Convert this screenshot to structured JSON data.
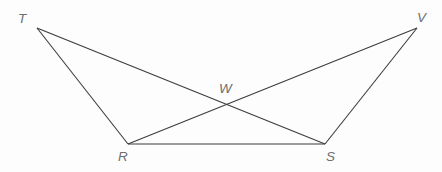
{
  "figure": {
    "kind": "geometry-diagram",
    "width": 442,
    "height": 172,
    "background_color": "#fdfdfd",
    "line_color": "#3c3c3c",
    "line_width": 1.1,
    "label_color": "#6e6e6e",
    "points": {
      "T": {
        "label": "T",
        "x": 37,
        "y": 28,
        "label_x": 18,
        "label_y": 12
      },
      "V": {
        "label": "V",
        "x": 417,
        "y": 28,
        "label_x": 417,
        "label_y": 11
      },
      "R": {
        "label": "R",
        "x": 128,
        "y": 144,
        "label_x": 118,
        "label_y": 150
      },
      "S": {
        "label": "S",
        "x": 325,
        "y": 144,
        "label_x": 326,
        "label_y": 150
      },
      "W": {
        "label": "W",
        "x": 226,
        "y": 105,
        "label_x": 219,
        "label_y": 82
      }
    },
    "segments": [
      {
        "name": "segment-TR",
        "from": "T",
        "to": "R"
      },
      {
        "name": "segment-TS",
        "from": "T",
        "to": "S"
      },
      {
        "name": "segment-VR",
        "from": "V",
        "to": "R"
      },
      {
        "name": "segment-VS",
        "from": "V",
        "to": "S"
      },
      {
        "name": "segment-RS",
        "from": "R",
        "to": "S"
      }
    ]
  }
}
